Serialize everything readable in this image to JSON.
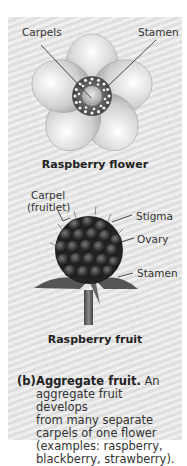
{
  "flower": {
    "labels": {
      "carpels": "Carpels",
      "stamen": "Stamen"
    },
    "caption": "Raspberry flower"
  },
  "fruit": {
    "labels": {
      "carpel_line1": "Carpel",
      "carpel_line2": "(fruitlet)",
      "stigma": "Stigma",
      "ovary": "Ovary",
      "stamen": "Stamen"
    },
    "caption": "Raspberry fruit"
  },
  "description": {
    "marker": "(b)",
    "heading": "Aggregate fruit.",
    "text_lines": [
      "An",
      "aggregate fruit develops",
      "from many separate",
      "carpels of one flower",
      "(examples: raspberry,",
      "blackberry, strawberry)."
    ]
  },
  "colors": {
    "panel": "#e6e6e6",
    "text": "#333333",
    "caption": "#222222"
  }
}
